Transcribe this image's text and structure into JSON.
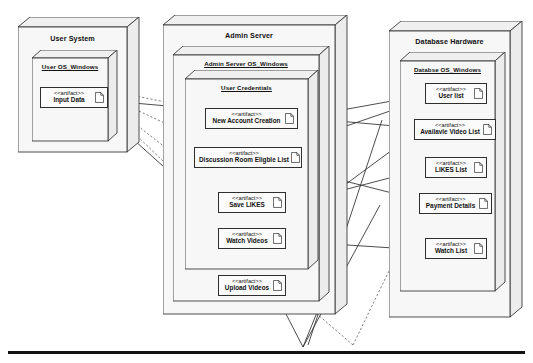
{
  "diagram": {
    "kind": "uml-deployment-diagram",
    "nodes": [
      {
        "id": "user-system",
        "title": "User System",
        "underlined": false,
        "env": {
          "title": "User OS_Windows",
          "underlined": true
        },
        "artifacts": [
          {
            "stereotype": "<<artifact>>",
            "name": "Input Data"
          }
        ]
      },
      {
        "id": "admin-server",
        "title": "Admin Server",
        "underlined": false,
        "env": {
          "title": "Admin Server OS_Windows",
          "underlined": true
        },
        "inner": {
          "title": "User Credentials",
          "underlined": true
        },
        "artifacts": [
          {
            "stereotype": "<<artifact>>",
            "name": "New Account Creation"
          },
          {
            "stereotype": "<<artifact>>",
            "name": "Discussion Room Eligble List"
          },
          {
            "stereotype": "<<artifact>>",
            "name": "Save LIKES"
          },
          {
            "stereotype": "<<artifact>>",
            "name": "Watch Videos"
          },
          {
            "stereotype": "<<artifact>>",
            "name": "Upload Videos"
          }
        ]
      },
      {
        "id": "database-hardware",
        "title": "Database Hardware",
        "underlined": false,
        "env": {
          "title": "Databse OS_Windows",
          "underlined": true
        },
        "artifacts": [
          {
            "stereotype": "<<artifact>>",
            "name": "User list"
          },
          {
            "stereotype": "<<artifact>>",
            "name": "Availavle Video List"
          },
          {
            "stereotype": "<<artifact>>",
            "name": "LIKES List"
          },
          {
            "stereotype": "<<artifact>>",
            "name": "Payment Details"
          },
          {
            "stereotype": "<<artifact>>",
            "name": "Watch List"
          }
        ]
      }
    ],
    "colors": {
      "stroke": "#2e2e2e",
      "node_face": "#f7f7f7",
      "node_top": "#f0f0f0",
      "node_side": "#ececec",
      "baseline": "#111111"
    }
  }
}
